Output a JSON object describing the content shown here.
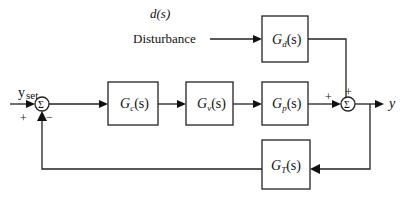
{
  "diagram": {
    "type": "feedback-control-block-diagram",
    "disturbance": {
      "symbol": "d(s)",
      "label": "Disturbance"
    },
    "input": {
      "label_main": "y",
      "label_sub": "set",
      "sign": "+"
    },
    "blocks": [
      {
        "id": "Gc",
        "main": "G",
        "sub": "c",
        "arg": "(s)"
      },
      {
        "id": "Gv",
        "main": "G",
        "sub": "v",
        "arg": "(s)"
      },
      {
        "id": "Gp",
        "main": "G",
        "sub": "p",
        "arg": "(s)"
      },
      {
        "id": "Gd",
        "main": "G",
        "sub": "d",
        "arg": "(s)"
      },
      {
        "id": "GT",
        "main": "G",
        "sub": "T",
        "arg": "(s)"
      }
    ],
    "sum1": {
      "symbol": "Σ",
      "feedback_sign": "−"
    },
    "sum2": {
      "symbol": "Σ",
      "sign_left": "+",
      "sign_top": "+"
    },
    "output": {
      "label": "y"
    },
    "colors": {
      "line": "#222222",
      "background": "#ffffff"
    }
  }
}
